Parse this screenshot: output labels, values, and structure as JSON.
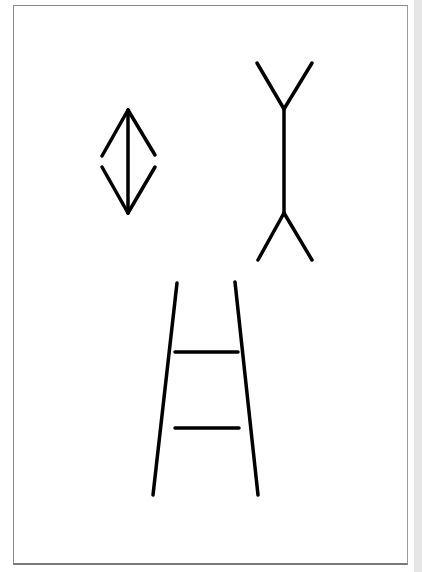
{
  "figure": {
    "title": "",
    "frame": {
      "x": 13,
      "y": 5,
      "width": 394,
      "height": 558,
      "border_color": "#8a8a8a"
    },
    "stroke_color": "#000000",
    "stroke_width": 3.5,
    "panels": [
      {
        "name": "muller-lyer-arrows-in",
        "shaft": {
          "x1": 128,
          "y1": 110,
          "x2": 128,
          "y2": 213
        },
        "fins": [
          {
            "x1": 128,
            "y1": 110,
            "x2": 102,
            "y2": 156
          },
          {
            "x1": 128,
            "y1": 110,
            "x2": 155,
            "y2": 155
          },
          {
            "x1": 128,
            "y1": 213,
            "x2": 102,
            "y2": 167
          },
          {
            "x1": 128,
            "y1": 213,
            "x2": 155,
            "y2": 167
          }
        ]
      },
      {
        "name": "muller-lyer-arrows-out",
        "shaft": {
          "x1": 284,
          "y1": 109,
          "x2": 284,
          "y2": 213
        },
        "fins": [
          {
            "x1": 284,
            "y1": 109,
            "x2": 257,
            "y2": 63
          },
          {
            "x1": 284,
            "y1": 109,
            "x2": 312,
            "y2": 63
          },
          {
            "x1": 284,
            "y1": 213,
            "x2": 258,
            "y2": 260
          },
          {
            "x1": 284,
            "y1": 213,
            "x2": 312,
            "y2": 260
          }
        ]
      },
      {
        "name": "ponzo",
        "rails": [
          {
            "x1": 177,
            "y1": 283,
            "x2": 153,
            "y2": 495
          },
          {
            "x1": 235,
            "y1": 282,
            "x2": 258,
            "y2": 495
          }
        ],
        "bars": [
          {
            "x1": 175,
            "y1": 352,
            "x2": 238,
            "y2": 352
          },
          {
            "x1": 175,
            "y1": 428,
            "x2": 239,
            "y2": 428
          }
        ]
      }
    ]
  }
}
